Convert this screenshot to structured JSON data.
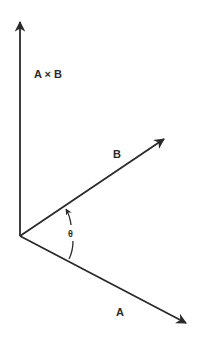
{
  "diagram": {
    "labels": {
      "cross_product": "A × B",
      "vector_b": "B",
      "vector_a": "A",
      "angle": "θ"
    },
    "stroke_color": "#2a2a2a",
    "background": "#ffffff"
  }
}
